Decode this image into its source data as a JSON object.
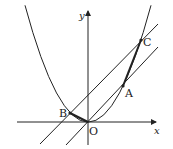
{
  "diagram": {
    "type": "coordinate-geometry",
    "axes": {
      "x_label": "x",
      "y_label": "y",
      "origin_label": "O"
    },
    "curve": {
      "type": "parabola",
      "vertex": "O",
      "opens": "up"
    },
    "points": [
      {
        "name": "B",
        "label": "B"
      },
      {
        "name": "A",
        "label": "A"
      },
      {
        "name": "C",
        "label": "C"
      },
      {
        "name": "O",
        "label": "O"
      }
    ],
    "lines": [
      {
        "name": "line-OA",
        "through": [
          "O",
          "A"
        ]
      },
      {
        "name": "line-BC",
        "through": [
          "B",
          "C"
        ]
      }
    ],
    "segments": [
      {
        "name": "segment-BO",
        "through": [
          "B",
          "O"
        ],
        "style": "bold"
      },
      {
        "name": "segment-AC",
        "through": [
          "A",
          "C"
        ],
        "style": "bold"
      }
    ],
    "colors": {
      "stroke": "#222222",
      "background": "#ffffff"
    }
  }
}
